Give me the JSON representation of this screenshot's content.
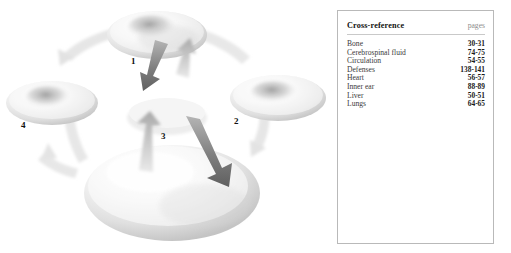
{
  "figure": {
    "type": "cyclic-process-diagram",
    "background_color": "#ffffff",
    "steps": [
      {
        "number": "1",
        "shape": "torus-disc",
        "position": "top"
      },
      {
        "number": "2",
        "shape": "torus-disc",
        "position": "right"
      },
      {
        "number": "3",
        "shape": "large-torus-disc",
        "position": "bottom"
      },
      {
        "number": "4",
        "shape": "torus-disc",
        "position": "left"
      }
    ],
    "arrows": {
      "dark_color": "#6e6e6e",
      "mid_color": "#b0b0b0",
      "pale_color": "#e4e4e4"
    }
  },
  "crossref": {
    "title": "Cross-reference",
    "pages_header": "pages",
    "rows": [
      {
        "topic": "Bone",
        "pages": "30-31"
      },
      {
        "topic": "Cerebrospinal fluid",
        "pages": "74-75"
      },
      {
        "topic": "Circulation",
        "pages": "54-55"
      },
      {
        "topic": "Defenses",
        "pages": "138-141"
      },
      {
        "topic": "Heart",
        "pages": "56-57"
      },
      {
        "topic": "Inner ear",
        "pages": "88-89"
      },
      {
        "topic": "Liver",
        "pages": "50-51"
      },
      {
        "topic": "Lungs",
        "pages": "64-65"
      }
    ]
  }
}
